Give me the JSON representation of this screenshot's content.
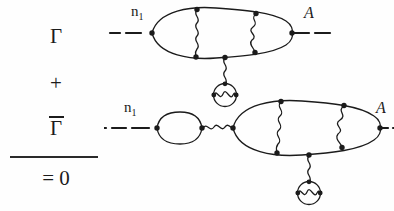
{
  "figure": {
    "name": "feynman-diagram-equation",
    "background_color": "#fefefe",
    "ink_color": "#1b1b1b"
  },
  "equation": {
    "term1": "Γ",
    "operator": "+",
    "term2": "Γ",
    "term2_has_overbar": true,
    "result": "= 0"
  },
  "diagrams": [
    {
      "id": "diagram-top",
      "external_leg_left_label": "n",
      "external_leg_left_subscript": "1",
      "external_leg_right_label": "ᴀ",
      "external_leg_right_script": "A",
      "structure": "main-loop-with-two-photon-insertions-and-vacuum-polarization-bubble"
    },
    {
      "id": "diagram-bottom",
      "external_leg_left_label": "n",
      "external_leg_left_subscript": "1",
      "external_leg_right_label": "ᴀ",
      "external_leg_right_script": "A",
      "structure": "self-energy-bubble-photon-then-main-loop-with-two-photon-insertions-and-vacuum-polarization-bubble"
    }
  ],
  "labels": {
    "n_base": "n",
    "n_sub": "1",
    "a_script": "A"
  }
}
